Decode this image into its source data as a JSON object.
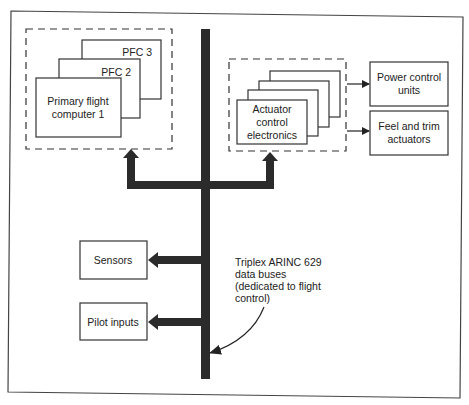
{
  "diagram": {
    "type": "block-diagram",
    "colors": {
      "stroke": "#333333",
      "bus": "#2b2b2b",
      "background": "#ffffff",
      "text": "#222222"
    },
    "pfc_group": {
      "cards": [
        {
          "label": "PFC 3"
        },
        {
          "label": "PFC 2"
        },
        {
          "label_line1": "Primary flight",
          "label_line2": "computer 1"
        }
      ]
    },
    "ace_group": {
      "card_count": 4,
      "label_line1": "Actuator",
      "label_line2": "control",
      "label_line3": "electronics"
    },
    "outputs": [
      {
        "label_line1": "Power control",
        "label_line2": "units"
      },
      {
        "label_line1": "Feel and trim",
        "label_line2": "actuators"
      }
    ],
    "inputs": [
      {
        "label": "Sensors"
      },
      {
        "label": "Pilot inputs"
      }
    ],
    "bus_annotation": {
      "line1": "Triplex ARINC 629",
      "line2": "data buses",
      "line3": "(dedicated to flight",
      "line4": "control)"
    }
  }
}
